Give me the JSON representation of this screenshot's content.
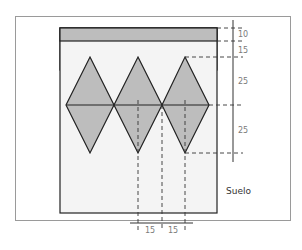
{
  "diagram": {
    "type": "wall-pattern-dimension-diagram",
    "colors": {
      "frame": "#9a9a9a",
      "wall_fill": "#f4f4f4",
      "band_fill": "#bdbdbd",
      "diamond_fill": "#bdbdbd",
      "stroke": "#222222",
      "dimension": "#333333"
    },
    "vertical_dimensions": [
      {
        "label": "10"
      },
      {
        "label": "15"
      },
      {
        "label": "25"
      },
      {
        "label": "25"
      }
    ],
    "horizontal_dimensions": [
      {
        "label": "15"
      },
      {
        "label": "15"
      }
    ],
    "floor_label": "Suelo",
    "diamond_count": 3
  }
}
